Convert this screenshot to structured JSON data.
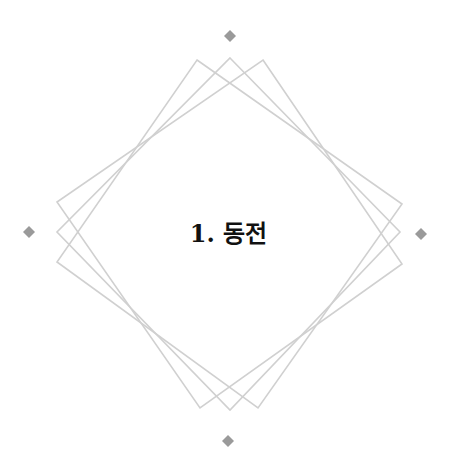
{
  "title": "1. 동전",
  "colors": {
    "frame_stroke": "#d0d0d0",
    "diamond_fill": "#9a9a9a",
    "text": "#111111"
  },
  "decorations": {
    "diamonds": [
      "top",
      "left",
      "right",
      "bottom"
    ],
    "frames": 3
  }
}
